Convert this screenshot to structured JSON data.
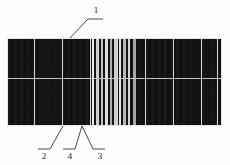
{
  "figure": {
    "kind": "patent-line-drawing",
    "background_color": "#ffffff",
    "line_color": "#1a1a1a",
    "panel": {
      "x": 7,
      "y": 38,
      "width": 215,
      "height": 88,
      "fill_color": "#0a0a0a",
      "border_color": "#e6e6e6",
      "horizontal_busbar_y": 40,
      "horizontal_busbar_color": "#c9c9c9",
      "cell_divider_color": "#d8d8d8",
      "cell_divider_x": [
        27,
        55,
        83,
        110,
        138,
        166,
        194,
        210
      ],
      "bright_stripes": [
        {
          "x": 85,
          "width": 2,
          "color": "#ffffff"
        },
        {
          "x": 89,
          "width": 3,
          "color": "#e0e0e0"
        },
        {
          "x": 94,
          "width": 2,
          "color": "#cfcfcf"
        },
        {
          "x": 98,
          "width": 3,
          "color": "#efefef"
        },
        {
          "x": 103,
          "width": 2,
          "color": "#bdbdbd"
        },
        {
          "x": 107,
          "width": 3,
          "color": "#dedede"
        },
        {
          "x": 112,
          "width": 2,
          "color": "#f5f5f5"
        },
        {
          "x": 116,
          "width": 3,
          "color": "#c6c6c6"
        },
        {
          "x": 121,
          "width": 2,
          "color": "#e8e8e8"
        },
        {
          "x": 126,
          "width": 3,
          "color": "#b4b4b4"
        }
      ]
    }
  },
  "callouts": [
    {
      "id": "callout-1",
      "label": "1",
      "label_x": 90,
      "label_y": 6,
      "underline": {
        "x1": 88,
        "y1": 19,
        "x2": 103,
        "y2": 19
      },
      "leader": {
        "x1": 88,
        "y1": 19,
        "x2": 70,
        "y2": 38
      }
    },
    {
      "id": "callout-2",
      "label": "2",
      "label_x": 38,
      "label_y": 152,
      "underline": {
        "x1": 38,
        "y1": 149,
        "x2": 50,
        "y2": 149
      },
      "leader": {
        "x1": 50,
        "y1": 149,
        "x2": 63,
        "y2": 126
      }
    },
    {
      "id": "callout-4",
      "label": "4",
      "label_x": 64,
      "label_y": 152,
      "underline": {
        "x1": 63,
        "y1": 149,
        "x2": 75,
        "y2": 149
      },
      "leader": {
        "x1": 75,
        "y1": 149,
        "x2": 82,
        "y2": 126
      }
    },
    {
      "id": "callout-3",
      "label": "3",
      "label_x": 94,
      "label_y": 152,
      "underline": {
        "x1": 93,
        "y1": 149,
        "x2": 105,
        "y2": 149
      },
      "leader": {
        "x1": 93,
        "y1": 149,
        "x2": 82,
        "y2": 126
      }
    }
  ]
}
